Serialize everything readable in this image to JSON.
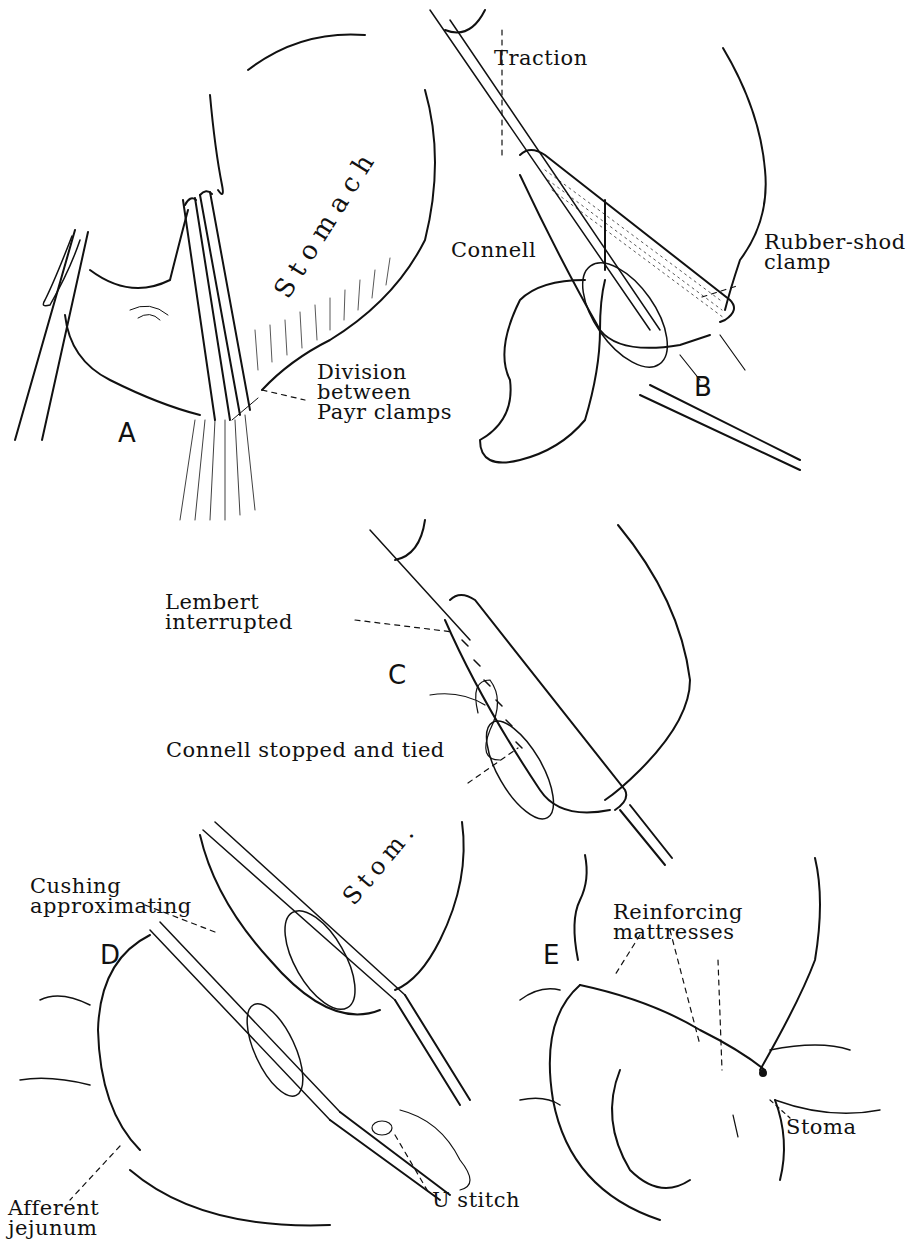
{
  "figure": {
    "type": "surgical-technique-illustration",
    "style": "black ink line drawing on white",
    "colors": {
      "ink": "#111111",
      "background": "#ffffff"
    },
    "panels": [
      {
        "id": "A",
        "label": "A",
        "organ_label": "Stomach",
        "annotations": [
          {
            "text": "Division\nbetween\nPayr clamps"
          }
        ]
      },
      {
        "id": "B",
        "label": "B",
        "annotations": [
          {
            "text": "Traction"
          },
          {
            "text": "Connell"
          },
          {
            "text": "Rubber-shod\nclamp"
          }
        ]
      },
      {
        "id": "C",
        "label": "C",
        "annotations": [
          {
            "text": "Lembert\ninterrupted"
          },
          {
            "text": "Connell stopped and tied"
          }
        ]
      },
      {
        "id": "D",
        "label": "D",
        "organ_label": "Stom.",
        "annotations": [
          {
            "text": "Cushing\napproximating"
          },
          {
            "text": "Afferent\njejunum"
          },
          {
            "text": "U stitch"
          }
        ]
      },
      {
        "id": "E",
        "label": "E",
        "annotations": [
          {
            "text": "Reinforcing\nmattresses"
          },
          {
            "text": "Stoma"
          }
        ]
      }
    ]
  }
}
